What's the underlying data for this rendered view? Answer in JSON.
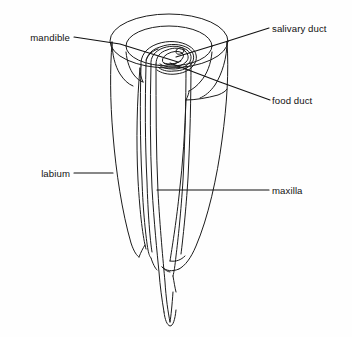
{
  "figure": {
    "name": "insect-mouthparts-cutaway-diagram",
    "background_color": "#fefefe",
    "line_color": "#1c1c1c",
    "label_color": "#111111"
  },
  "labels": [
    {
      "id": "mandible",
      "text": "mandible",
      "side": "left",
      "text_x": 70,
      "text_y": 41,
      "leader_points": "74,37 120,44 178,62"
    },
    {
      "id": "salivary-duct",
      "text": "salivary duct",
      "side": "right",
      "text_x": 272,
      "text_y": 32,
      "leader_points": "269,28 225,42 176,57"
    },
    {
      "id": "food-duct",
      "text": "food duct",
      "side": "right",
      "text_x": 272,
      "text_y": 104,
      "leader_points": "270,100 220,82 170,63"
    },
    {
      "id": "labium",
      "text": "labium",
      "side": "left",
      "text_x": 70,
      "text_y": 177,
      "leader_points": "74,173 113,173"
    },
    {
      "id": "maxilla",
      "text": "maxilla",
      "side": "right",
      "text_x": 272,
      "text_y": 194,
      "leader_points": "269,190 200,190 157,190"
    }
  ],
  "structures": [
    {
      "id": "labium-sheath",
      "label": "labium"
    },
    {
      "id": "maxilla-stylet",
      "label": "maxilla"
    },
    {
      "id": "mandible-stylet",
      "label": "mandible"
    },
    {
      "id": "food-canal",
      "label": "food duct"
    },
    {
      "id": "salivary-canal",
      "label": "salivary duct"
    }
  ]
}
